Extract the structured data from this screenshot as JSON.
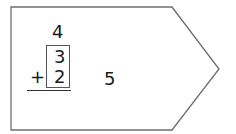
{
  "problem": {
    "top_number": "4",
    "addend_1": "3",
    "addend_2": "2",
    "operator": "+",
    "answer": "5"
  },
  "colors": {
    "outline": "#6e6e6e",
    "text": "#1a1a1a",
    "background": "#ffffff"
  }
}
